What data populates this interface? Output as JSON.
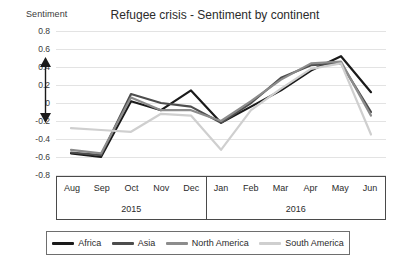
{
  "chart_data": {
    "type": "line",
    "title": "Refugee crisis - Sentiment by continent",
    "xlabel": "",
    "ylabel": "Sentiment",
    "ylim": [
      -0.8,
      0.8
    ],
    "ytick_values": [
      0.8,
      0.6,
      0.4,
      0.2,
      0,
      -0.2,
      -0.4,
      -0.6,
      -0.8
    ],
    "ytick_labels": [
      "0.8",
      "0.6",
      "0.4",
      "0.2",
      "0",
      "-0.2",
      "-0.4",
      "-0.6",
      "-0.8"
    ],
    "grid": true,
    "legend_position": "bottom",
    "categories": [
      "Aug",
      "Sep",
      "Oct",
      "Nov",
      "Dec",
      "Jan",
      "Feb",
      "Mar",
      "Apr",
      "May",
      "Jun"
    ],
    "group_labels": [
      "2015",
      "2016"
    ],
    "group_spans": [
      5,
      6
    ],
    "series": [
      {
        "name": "Africa",
        "color": "#1a1a1a",
        "values": [
          -0.56,
          -0.6,
          0.02,
          -0.08,
          0.14,
          -0.22,
          -0.04,
          0.14,
          0.36,
          0.52,
          0.12
        ]
      },
      {
        "name": "Asia",
        "color": "#4d4d4d",
        "values": [
          -0.55,
          -0.58,
          0.1,
          0.0,
          -0.04,
          -0.22,
          0.0,
          0.28,
          0.42,
          0.44,
          -0.1
        ]
      },
      {
        "name": "North America",
        "color": "#8c8c8c",
        "values": [
          -0.52,
          -0.56,
          0.06,
          -0.08,
          -0.08,
          -0.2,
          0.02,
          0.26,
          0.44,
          0.46,
          -0.14
        ]
      },
      {
        "name": "South America",
        "color": "#cfcfcf",
        "values": [
          -0.28,
          -0.3,
          -0.32,
          -0.12,
          -0.14,
          -0.52,
          -0.08,
          0.16,
          0.38,
          0.44,
          -0.35
        ]
      }
    ],
    "annotations": [
      {
        "type": "double-arrow",
        "label": "",
        "from": 0.38,
        "to": -0.32
      }
    ]
  }
}
